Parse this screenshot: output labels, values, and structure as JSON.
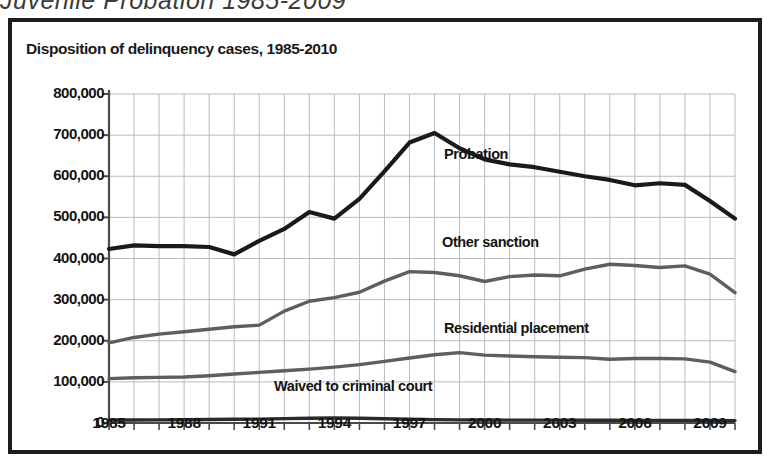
{
  "page": {
    "heading_partial": "Juvenile Probation 1985-2009"
  },
  "figure": {
    "title": "Disposition of delinquency cases, 1985-2010"
  },
  "chart_data": {
    "type": "line",
    "title": "Disposition of delinquency cases, 1985-2010",
    "xlabel": "",
    "ylabel": "",
    "xlim": [
      1985,
      2010
    ],
    "ylim": [
      0,
      800000
    ],
    "grid": true,
    "legend": "inline-annotations",
    "ytick_labels": [
      "800,000",
      "700,000",
      "600,000",
      "500,000",
      "400,000",
      "300,000",
      "200,000",
      "100,000",
      "0"
    ],
    "ytick_values": [
      800000,
      700000,
      600000,
      500000,
      400000,
      300000,
      200000,
      100000,
      0
    ],
    "xtick_labels": [
      "1985",
      "1988",
      "1991",
      "1994",
      "1997",
      "2000",
      "2003",
      "2006",
      "2009"
    ],
    "xtick_values": [
      1985,
      1988,
      1991,
      1994,
      1997,
      2000,
      2003,
      2006,
      2009
    ],
    "x": [
      1985,
      1986,
      1987,
      1988,
      1989,
      1990,
      1991,
      1992,
      1993,
      1994,
      1995,
      1996,
      1997,
      1998,
      1999,
      2000,
      2001,
      2002,
      2003,
      2004,
      2005,
      2006,
      2007,
      2008,
      2009,
      2010
    ],
    "series": [
      {
        "name": "Probation",
        "color": "#1a1a1a",
        "values": [
          423000,
          432000,
          430000,
          430000,
          428000,
          410000,
          443000,
          472000,
          513000,
          497000,
          545000,
          612000,
          682000,
          705000,
          668000,
          641000,
          629000,
          622000,
          611000,
          600000,
          591000,
          578000,
          583000,
          579000,
          540000,
          497000
        ]
      },
      {
        "name": "Other sanction",
        "color": "#5e5e5e",
        "values": [
          195000,
          208000,
          216000,
          222000,
          228000,
          234000,
          238000,
          272000,
          296000,
          305000,
          318000,
          345000,
          368000,
          366000,
          358000,
          344000,
          356000,
          360000,
          358000,
          374000,
          386000,
          383000,
          378000,
          382000,
          362000,
          317000
        ]
      },
      {
        "name": "Residential placement",
        "color": "#5e5e5e",
        "values": [
          108000,
          110000,
          111000,
          112000,
          115000,
          119000,
          123000,
          127000,
          131000,
          136000,
          142000,
          150000,
          158000,
          166000,
          171000,
          165000,
          163000,
          161000,
          160000,
          159000,
          155000,
          157000,
          157000,
          156000,
          148000,
          125000
        ]
      },
      {
        "name": "Waived to criminal court",
        "color": "#2b2b2b",
        "values": [
          7200,
          7400,
          7600,
          8000,
          8500,
          9000,
          9400,
          10700,
          11700,
          12100,
          11700,
          10500,
          9000,
          8200,
          7700,
          7400,
          7100,
          7000,
          7000,
          6800,
          6600,
          6500,
          6400,
          6300,
          6100,
          5800
        ]
      }
    ],
    "annotations": [
      {
        "text": "Probation",
        "series": "Probation"
      },
      {
        "text": "Other sanction",
        "series": "Other sanction"
      },
      {
        "text": "Residential placement",
        "series": "Residential placement"
      },
      {
        "text": "Waived to criminal court",
        "series": "Waived to criminal court"
      }
    ]
  },
  "colors": {
    "frame": "#1c1c1c",
    "grid": "#b9b9c4",
    "axis": "#4a4a4a",
    "text": "#141414",
    "background": "#ffffff"
  }
}
